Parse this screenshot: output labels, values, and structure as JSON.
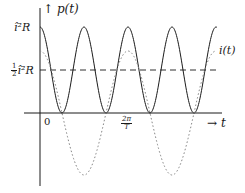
{
  "figure": {
    "y_axis_label": "p(t)",
    "x_axis_label": "t",
    "origin_label": "0",
    "y_tick_top": "î²R",
    "y_tick_half_num": "1",
    "y_tick_half_den": "2",
    "y_tick_half_rest": "î²R",
    "x_tick_num": "2π",
    "x_tick_den": "T",
    "curve_label": "i(t)",
    "colors": {
      "ink": "#1a1a1a",
      "dotted": "#888888"
    }
  },
  "chart_data": {
    "type": "line",
    "title": "",
    "xlabel": "t",
    "ylabel": "p(t)",
    "series": [
      {
        "name": "p(t) = î²R cos²(ωt)",
        "style": "solid",
        "description": "oscillates between 0 and î²R with half the period of i(t)"
      },
      {
        "name": "i(t)",
        "style": "dotted",
        "description": "cosine current, amplitude î, period = 2 × period of p(t)"
      },
      {
        "name": "½ î²R",
        "style": "dashed",
        "description": "average power level"
      }
    ],
    "y_ticks": [
      "½ î²R",
      "î²R"
    ],
    "x_ticks": [
      "0",
      "2π/T"
    ],
    "grid": false
  }
}
